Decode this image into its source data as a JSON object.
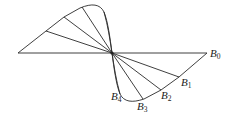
{
  "diagram": {
    "center": {
      "x": 112,
      "y": 53
    },
    "labels": [
      {
        "id": "B0",
        "base": "B",
        "sub": "0",
        "x": 210,
        "y": 57
      },
      {
        "id": "B1",
        "base": "B",
        "sub": "1",
        "x": 181,
        "y": 86
      },
      {
        "id": "B2",
        "base": "B",
        "sub": "2",
        "x": 161,
        "y": 99
      },
      {
        "id": "B3",
        "base": "B",
        "sub": "3",
        "x": 137,
        "y": 110
      },
      {
        "id": "B4",
        "base": "B",
        "sub": "4",
        "x": 111,
        "y": 100
      }
    ]
  }
}
